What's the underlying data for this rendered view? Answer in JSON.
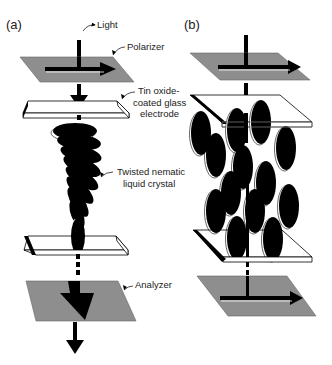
{
  "figure": {
    "panels": [
      {
        "id": "a",
        "label": "(a)"
      },
      {
        "id": "b",
        "label": "(b)"
      }
    ],
    "callouts": {
      "light": "Light",
      "polarizer": "Polarizer",
      "electrode_line1": "Tin oxide-",
      "electrode_line2": "coated glass",
      "electrode_line3": "electrode",
      "lc_line1": "Twisted nematic",
      "lc_line2": "liquid crystal",
      "analyzer": "Analyzer"
    },
    "colors": {
      "polarizer_fill": "#8e8e8e",
      "glass_fill": "#ffffff",
      "ink": "#000000"
    }
  }
}
